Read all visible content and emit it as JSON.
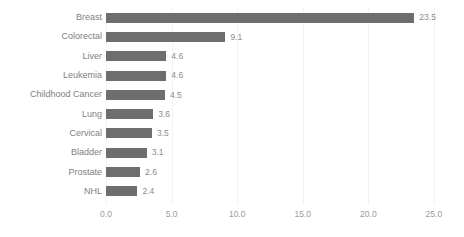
{
  "chart_data": {
    "type": "bar",
    "orientation": "horizontal",
    "title": "",
    "subtitle": "",
    "xlabel": "",
    "ylabel": "",
    "categories": [
      "Breast",
      "Colorectal",
      "Liver",
      "Leukemia",
      "Childhood Cancer",
      "Lung",
      "Cervical",
      "Bladder",
      "Prostate",
      "NHL"
    ],
    "values": [
      23.5,
      9.1,
      4.6,
      4.6,
      4.5,
      3.6,
      3.5,
      3.1,
      2.6,
      2.4
    ],
    "value_labels": [
      "23.5",
      "9.1",
      "4.6",
      "4.6",
      "4.5",
      "3.6",
      "3.5",
      "3.1",
      "2.6",
      "2.4"
    ],
    "xlim": [
      0.0,
      25.0
    ],
    "xticks": [
      0.0,
      5.0,
      10.0,
      15.0,
      20.0,
      25.0
    ],
    "xtick_labels": [
      "0.0",
      "5.0",
      "10.0",
      "15.0",
      "20.0",
      "25.0"
    ],
    "grid": true,
    "grid_axis": "x",
    "legend": null,
    "colors": {
      "bar": "#6e6e6e",
      "background": "#ffffff",
      "category_label": "#808080",
      "value_label": "#8c8c8c",
      "tick_label": "#9a9a9a",
      "gridline": "#f2f2f2"
    }
  }
}
